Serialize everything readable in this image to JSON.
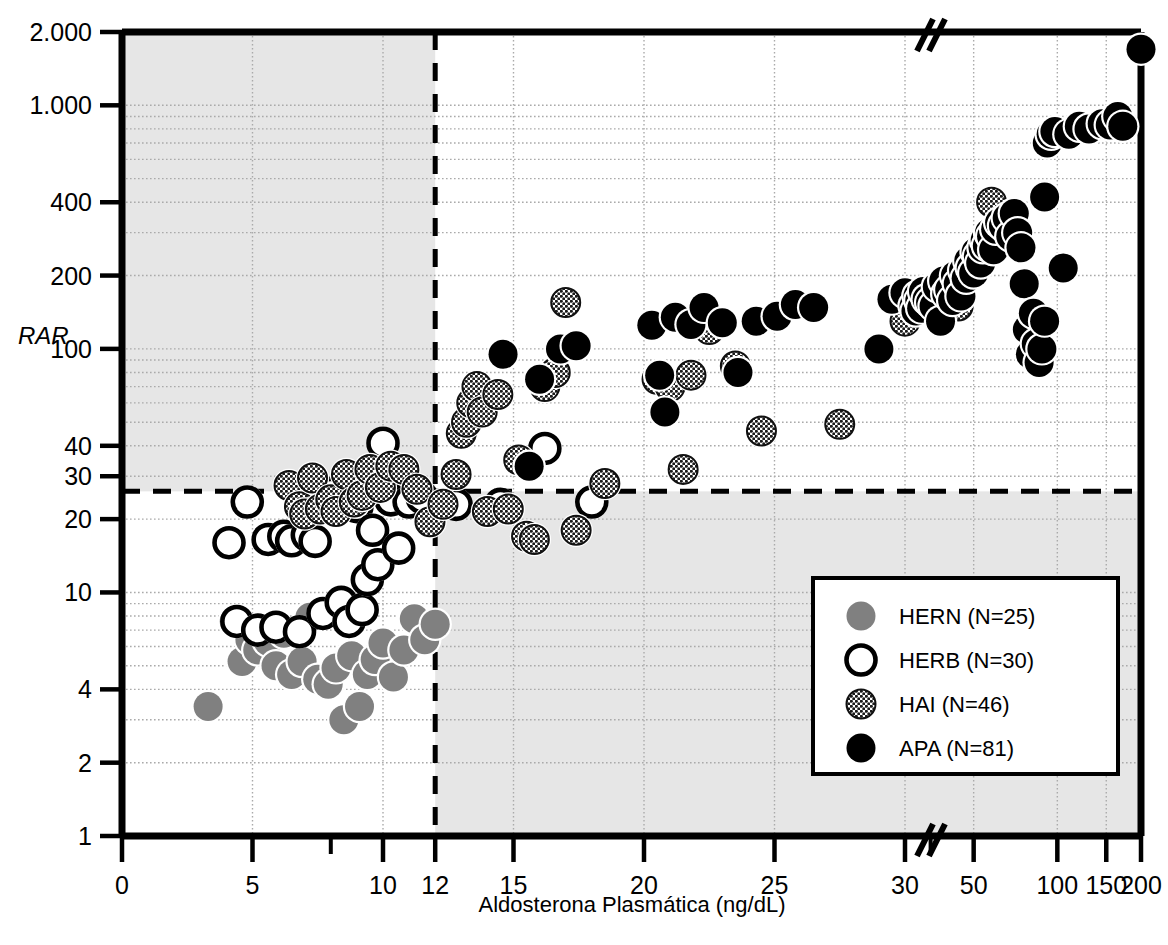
{
  "chart_data": {
    "type": "scatter",
    "title": "",
    "xlabel": "Aldosterona Plasmática (ng/dL)",
    "ylabel": "RAR",
    "yscale": "log",
    "xscale": "piecewise-linear-then-log",
    "grid": true,
    "axis_break_x": 35,
    "xticks": [
      0,
      5,
      10,
      12,
      15,
      20,
      25,
      30,
      50,
      100,
      150,
      200
    ],
    "xtick_labels": [
      "0",
      "5",
      "10",
      "12",
      "15",
      "20",
      "25",
      "30",
      "50",
      "100",
      "150",
      "200"
    ],
    "yticks": [
      1,
      2,
      4,
      10,
      20,
      30,
      40,
      100,
      200,
      400,
      1000,
      2000
    ],
    "ytick_labels": [
      "1",
      "2",
      "4",
      "10",
      "20",
      "30",
      "40",
      "100",
      "200",
      "400",
      "1.000",
      "2.000"
    ],
    "ylim": [
      1,
      2000
    ],
    "xlim": [
      0,
      200
    ],
    "threshold_lines": {
      "vertical_x": 12,
      "horizontal_y": 26,
      "style": "dashed"
    },
    "shaded_regions_note": "Light gray band: x<12 above RAR 26, and x>12 below RAR 26",
    "legend_position": "lower-right",
    "series": [
      {
        "name": "HERN",
        "label": "HERN (N=25)",
        "n": 25,
        "marker": "filled-gray-circle",
        "color": "#808080",
        "points": [
          [
            3.3,
            3.4
          ],
          [
            4.3,
            7.6
          ],
          [
            4.6,
            5.2
          ],
          [
            4.9,
            6.4
          ],
          [
            5.2,
            5.8
          ],
          [
            5.6,
            6.3
          ],
          [
            5.9,
            5.0
          ],
          [
            6.2,
            6.8
          ],
          [
            6.5,
            4.6
          ],
          [
            6.9,
            5.2
          ],
          [
            7.2,
            7.9
          ],
          [
            7.5,
            4.4
          ],
          [
            7.9,
            4.2
          ],
          [
            8.2,
            4.9
          ],
          [
            8.5,
            3.0
          ],
          [
            8.8,
            5.5
          ],
          [
            9.1,
            3.4
          ],
          [
            9.4,
            4.6
          ],
          [
            9.7,
            5.3
          ],
          [
            10.0,
            6.2
          ],
          [
            10.4,
            4.5
          ],
          [
            10.8,
            5.8
          ],
          [
            11.2,
            7.8
          ],
          [
            11.6,
            6.4
          ],
          [
            12.0,
            7.4
          ]
        ]
      },
      {
        "name": "HERB",
        "label": "HERB (N=30)",
        "n": 30,
        "marker": "open-circle",
        "color": "#ffffff",
        "edge": "#000000",
        "points": [
          [
            4.1,
            16.0
          ],
          [
            4.4,
            7.6
          ],
          [
            4.8,
            23.5
          ],
          [
            5.2,
            7.0
          ],
          [
            5.6,
            16.5
          ],
          [
            5.9,
            7.2
          ],
          [
            6.2,
            17.0
          ],
          [
            6.5,
            16.3
          ],
          [
            6.8,
            6.9
          ],
          [
            7.1,
            17.2
          ],
          [
            7.4,
            16.2
          ],
          [
            7.7,
            8.2
          ],
          [
            8.0,
            25.5
          ],
          [
            8.4,
            9.1
          ],
          [
            8.7,
            7.6
          ],
          [
            9.0,
            22.5
          ],
          [
            9.2,
            8.5
          ],
          [
            9.4,
            11.3
          ],
          [
            9.6,
            18.0
          ],
          [
            9.8,
            13.0
          ],
          [
            10.0,
            41.0
          ],
          [
            10.1,
            30.0
          ],
          [
            10.3,
            24.0
          ],
          [
            10.6,
            15.2
          ],
          [
            11.0,
            23.5
          ],
          [
            11.5,
            24.5
          ],
          [
            12.8,
            23.0
          ],
          [
            14.5,
            23.0
          ],
          [
            16.2,
            39.0
          ],
          [
            18.0,
            23.5
          ]
        ]
      },
      {
        "name": "HAI",
        "label": "HAI (N=46)",
        "n": 46,
        "marker": "hatched-circle",
        "color": "#4d4d4d",
        "points": [
          [
            6.4,
            27.5
          ],
          [
            6.8,
            22.5
          ],
          [
            7.0,
            21.0
          ],
          [
            7.3,
            29.5
          ],
          [
            7.6,
            22.0
          ],
          [
            8.0,
            24.0
          ],
          [
            8.2,
            21.5
          ],
          [
            8.6,
            30.5
          ],
          [
            8.9,
            23.5
          ],
          [
            9.2,
            25.0
          ],
          [
            9.5,
            32.0
          ],
          [
            9.9,
            27.0
          ],
          [
            10.3,
            33.0
          ],
          [
            10.8,
            32.0
          ],
          [
            11.3,
            26.5
          ],
          [
            11.8,
            19.5
          ],
          [
            12.3,
            23.0
          ],
          [
            12.8,
            30.5
          ],
          [
            13.0,
            45.0
          ],
          [
            13.2,
            50.0
          ],
          [
            13.4,
            60.0
          ],
          [
            13.6,
            70.0
          ],
          [
            13.8,
            55.0
          ],
          [
            14.0,
            21.5
          ],
          [
            14.4,
            65.0
          ],
          [
            14.8,
            22.0
          ],
          [
            15.2,
            35.0
          ],
          [
            15.5,
            17.0
          ],
          [
            15.8,
            16.5
          ],
          [
            16.2,
            70.0
          ],
          [
            16.6,
            80.0
          ],
          [
            17.0,
            155.0
          ],
          [
            17.4,
            18.0
          ],
          [
            18.5,
            28.0
          ],
          [
            20.5,
            75.0
          ],
          [
            21.0,
            70.0
          ],
          [
            21.5,
            32.0
          ],
          [
            21.8,
            78.0
          ],
          [
            22.5,
            120.0
          ],
          [
            23.5,
            85.0
          ],
          [
            24.5,
            46.0
          ],
          [
            27.5,
            49.0
          ],
          [
            30.0,
            130.0
          ],
          [
            38.0,
            140.0
          ],
          [
            44.0,
            150.0
          ],
          [
            58.0,
            400.0
          ]
        ]
      },
      {
        "name": "APA",
        "label": "APA (N=81)",
        "n": 81,
        "marker": "filled-black-circle",
        "color": "#000000",
        "points": [
          [
            14.6,
            95.0
          ],
          [
            15.6,
            33.0
          ],
          [
            16.0,
            75.0
          ],
          [
            16.8,
            100.0
          ],
          [
            17.4,
            103.0
          ],
          [
            20.3,
            125.0
          ],
          [
            20.6,
            78.0
          ],
          [
            20.8,
            55.0
          ],
          [
            21.2,
            135.0
          ],
          [
            21.8,
            126.0
          ],
          [
            22.3,
            148.0
          ],
          [
            23.0,
            128.0
          ],
          [
            23.6,
            80.0
          ],
          [
            24.3,
            130.0
          ],
          [
            25.1,
            136.0
          ],
          [
            25.8,
            152.0
          ],
          [
            26.5,
            148.0
          ],
          [
            29.0,
            100.0
          ],
          [
            29.5,
            160.0
          ],
          [
            30.0,
            170.0
          ],
          [
            30.5,
            150.0
          ],
          [
            31.0,
            143.0
          ],
          [
            31.5,
            165.0
          ],
          [
            32.0,
            158.0
          ],
          [
            32.5,
            147.0
          ],
          [
            33.0,
            172.0
          ],
          [
            34.0,
            160.0
          ],
          [
            35.0,
            155.0
          ],
          [
            36.0,
            150.0
          ],
          [
            37.0,
            180.0
          ],
          [
            38.0,
            130.0
          ],
          [
            39.0,
            190.0
          ],
          [
            40.0,
            168.0
          ],
          [
            41.0,
            175.0
          ],
          [
            42.0,
            158.0
          ],
          [
            43.0,
            200.0
          ],
          [
            44.0,
            185.0
          ],
          [
            45.0,
            165.0
          ],
          [
            46.0,
            210.0
          ],
          [
            47.0,
            195.0
          ],
          [
            48.0,
            230.0
          ],
          [
            49.0,
            215.0
          ],
          [
            50.0,
            205.0
          ],
          [
            51.0,
            250.0
          ],
          [
            52.0,
            240.0
          ],
          [
            53.0,
            225.0
          ],
          [
            54.0,
            260.0
          ],
          [
            55.0,
            280.0
          ],
          [
            56.0,
            265.0
          ],
          [
            57.0,
            300.0
          ],
          [
            58.0,
            290.0
          ],
          [
            59.0,
            255.0
          ],
          [
            60.0,
            310.0
          ],
          [
            62.0,
            330.0
          ],
          [
            64.0,
            320.0
          ],
          [
            66.0,
            345.0
          ],
          [
            68.0,
            290.0
          ],
          [
            70.0,
            360.0
          ],
          [
            72.0,
            300.0
          ],
          [
            74.0,
            260.0
          ],
          [
            76.0,
            185.0
          ],
          [
            78.0,
            120.0
          ],
          [
            80.0,
            95.0
          ],
          [
            82.0,
            140.0
          ],
          [
            84.0,
            105.0
          ],
          [
            86.0,
            88.0
          ],
          [
            88.0,
            100.0
          ],
          [
            90.0,
            420.0
          ],
          [
            92.0,
            700.0
          ],
          [
            95.0,
            760.0
          ],
          [
            98.0,
            780.0
          ],
          [
            105.0,
            215.0
          ],
          [
            110.0,
            760.0
          ],
          [
            120.0,
            820.0
          ],
          [
            130.0,
            800.0
          ],
          [
            145.0,
            840.0
          ],
          [
            155.0,
            830.0
          ],
          [
            165.0,
            900.0
          ],
          [
            172.0,
            820.0
          ],
          [
            90.0,
            130.0
          ],
          [
            200.0,
            1700.0
          ]
        ]
      }
    ]
  },
  "axes": {
    "y_axis_name": "RAR",
    "x_axis_title": "Aldosterona Plasmática (ng/dL)",
    "break_symbol": "//"
  },
  "legend": {
    "entries": [
      {
        "key": "hern",
        "label": "HERN (N=25)",
        "marker": "filled-gray-circle"
      },
      {
        "key": "herb",
        "label": "HERB (N=30)",
        "marker": "open-circle"
      },
      {
        "key": "hai",
        "label": "HAI (N=46)",
        "marker": "hatched-circle"
      },
      {
        "key": "apa",
        "label": "APA (N=81)",
        "marker": "filled-black-circle"
      }
    ]
  },
  "colors": {
    "plot_background": "#ffffff",
    "shaded_band": "#e6e6e6",
    "axis": "#000000",
    "gridline": "#aaaaaa",
    "hern_gray": "#808080",
    "hai_dark": "#4d4d4d",
    "apa_black": "#000000"
  }
}
